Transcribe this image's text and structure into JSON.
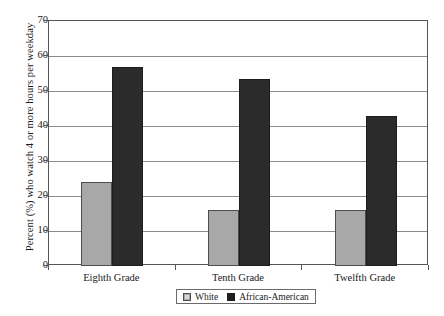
{
  "chart_data": {
    "type": "bar",
    "title": "",
    "xlabel": "",
    "ylabel": "Percent (%) who watch 4 or more hours per weekday",
    "categories": [
      "Eighth Grade",
      "Tenth Grade",
      "Twelfth Grade"
    ],
    "series": [
      {
        "name": "White",
        "values": [
          24,
          16,
          16
        ],
        "color": "#a8a8a8"
      },
      {
        "name": "African-American",
        "values": [
          57,
          53.5,
          43
        ],
        "color": "#2b2b2b"
      }
    ],
    "ylim": [
      0,
      70
    ],
    "ytick_labels": [
      "0",
      "10",
      "20",
      "30",
      "40",
      "50",
      "60",
      "70"
    ],
    "ytick_values": [
      0,
      10,
      20,
      30,
      40,
      50,
      60,
      70
    ],
    "grid": true,
    "legend_position": "bottom-center"
  }
}
